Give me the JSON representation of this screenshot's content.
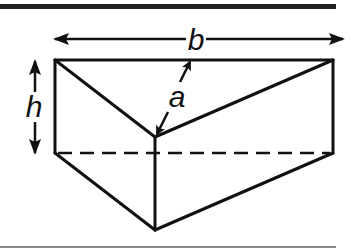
{
  "figure": {
    "colors": {
      "stroke": "#111111",
      "rule_top": "#222222",
      "rule_bottom": "#8a8a8a",
      "background": "#ffffff"
    },
    "labels": {
      "base_length": "b",
      "height": "h",
      "altitude": "a"
    },
    "dimensions": [
      {
        "symbol": "b",
        "meaning": "length of top edge (width)",
        "orientation": "horizontal"
      },
      {
        "symbol": "h",
        "meaning": "height of prism",
        "orientation": "vertical"
      },
      {
        "symbol": "a",
        "meaning": "altitude of triangular face",
        "orientation": "diagonal"
      }
    ]
  }
}
